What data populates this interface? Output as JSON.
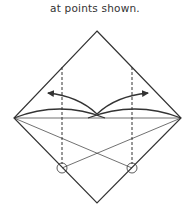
{
  "caption": "at points shown.",
  "colors": {
    "line": "#333333",
    "background": "#ffffff"
  },
  "diagram": {
    "shape": "square-diamond",
    "vertices": {
      "top": [
        97,
        31
      ],
      "left": [
        14,
        118
      ],
      "right": [
        181,
        118
      ],
      "bottom": [
        97,
        203
      ]
    },
    "dashed_lines": [
      {
        "x": 62,
        "y1": 67,
        "y2": 168
      },
      {
        "x": 132,
        "y1": 67,
        "y2": 168
      }
    ],
    "circles": [
      {
        "cx": 62,
        "cy": 168,
        "r": 5
      },
      {
        "cx": 132,
        "cy": 168,
        "r": 5
      }
    ],
    "arrows": [
      {
        "direction": "left"
      },
      {
        "direction": "right"
      }
    ]
  }
}
